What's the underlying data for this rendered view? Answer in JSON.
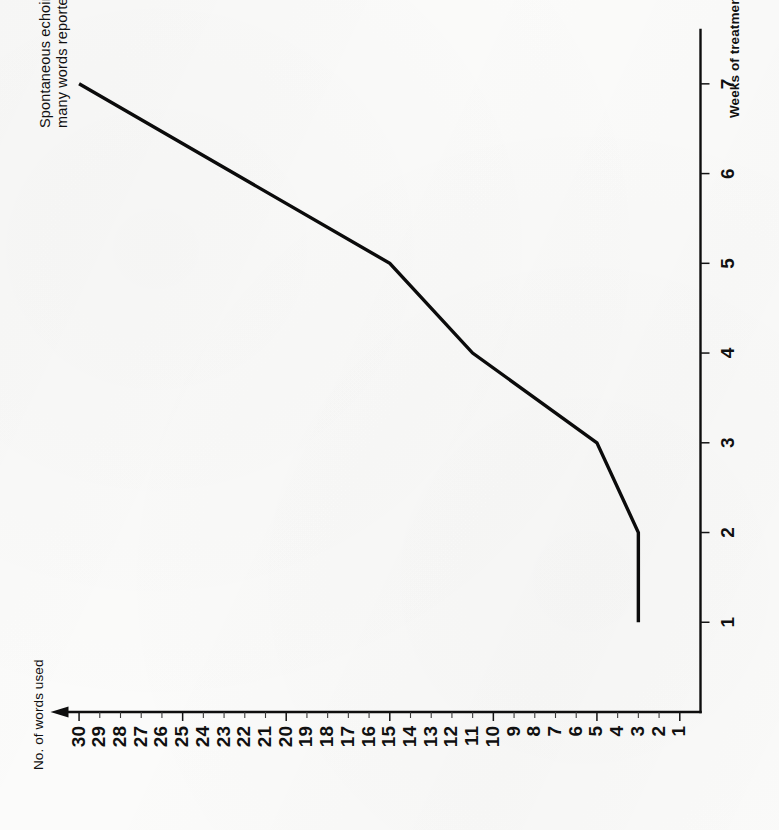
{
  "figure": {
    "annotation_line1": "Spontaneous echoing of",
    "annotation_line2": "many words reported"
  },
  "chart_data": {
    "type": "line",
    "title": "",
    "xlabel": "Weeks of treatment",
    "ylabel": "No. of words used",
    "x": [
      1,
      2,
      3,
      4,
      5,
      7
    ],
    "values": [
      3,
      3,
      5,
      11,
      15,
      30
    ],
    "series": [
      {
        "name": "No. of words used",
        "x": [
          1,
          2,
          3,
          4,
          5,
          7
        ],
        "values": [
          3,
          3,
          5,
          11,
          15,
          30
        ]
      }
    ],
    "xlim": [
      0,
      7.6
    ],
    "ylim": [
      0,
      30.8
    ],
    "xticks": [
      1,
      2,
      3,
      4,
      5,
      6,
      7
    ],
    "xtick_labels": [
      "1",
      "2",
      "3",
      "4",
      "5",
      "6",
      "7"
    ],
    "yticks": [
      1,
      2,
      3,
      4,
      5,
      6,
      7,
      8,
      9,
      10,
      11,
      12,
      13,
      14,
      15,
      16,
      17,
      18,
      19,
      20,
      21,
      22,
      23,
      24,
      25,
      26,
      27,
      28,
      29,
      30
    ],
    "ytick_labels": [
      "1",
      "2",
      "3",
      "4",
      "5",
      "6",
      "7",
      "8",
      "9",
      "10",
      "11",
      "12",
      "13",
      "14",
      "15",
      "16",
      "17",
      "18",
      "19",
      "20",
      "21",
      "22",
      "23",
      "24",
      "25",
      "26",
      "27",
      "28",
      "29",
      "30"
    ],
    "grid": false,
    "legend": false,
    "annotations": [
      {
        "text": "Spontaneous echoing of many words reported",
        "x": 7,
        "y": 30
      }
    ],
    "line_color": "#0b0b0b",
    "axis_color": "#0e0e0e",
    "background_color": "#fbfbfa"
  }
}
